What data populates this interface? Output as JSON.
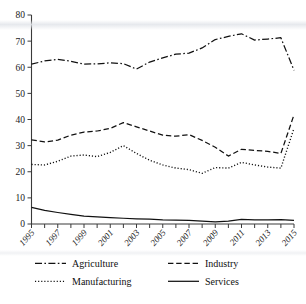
{
  "chart_data": {
    "type": "line",
    "title": "",
    "subtitle": "",
    "xlabel": "",
    "ylabel": "",
    "xlim": [
      1995,
      2015
    ],
    "ylim": [
      0,
      80
    ],
    "grid": false,
    "legend_position": "bottom",
    "x": [
      1995,
      1996,
      1997,
      1998,
      1999,
      2000,
      2001,
      2002,
      2003,
      2004,
      2005,
      2006,
      2007,
      2008,
      2009,
      2010,
      2011,
      2012,
      2013,
      2014,
      2015
    ],
    "x_tick_labels": [
      "1995",
      "1997",
      "1999",
      "2001",
      "2003",
      "2005",
      "2007",
      "2009",
      "2011",
      "2013",
      "2015"
    ],
    "x_tick_values": [
      1995,
      1997,
      1999,
      2001,
      2003,
      2005,
      2007,
      2009,
      2011,
      2013,
      2015
    ],
    "y_tick_labels": [
      "0",
      "10",
      "20",
      "30",
      "40",
      "50",
      "60",
      "70",
      "80"
    ],
    "y_tick_values": [
      0,
      10,
      20,
      30,
      40,
      50,
      60,
      70,
      80
    ],
    "series": [
      {
        "name": "Agriculture",
        "style": "dashdot",
        "color": "#111111",
        "values": [
          61.2,
          62.4,
          63.0,
          62.3,
          61.2,
          61.3,
          61.7,
          61.4,
          59.3,
          62.0,
          63.6,
          65.0,
          65.4,
          67.4,
          70.6,
          71.8,
          72.8,
          70.4,
          70.8,
          71.3,
          58.8
        ]
      },
      {
        "name": "Industry",
        "style": "dashed",
        "color": "#111111",
        "values": [
          32.2,
          31.4,
          32.1,
          34.0,
          35.2,
          35.6,
          36.6,
          38.8,
          37.2,
          35.6,
          34.0,
          33.6,
          34.2,
          32.0,
          29.4,
          26.0,
          28.6,
          28.2,
          27.8,
          27.0,
          41.8
        ]
      },
      {
        "name": "Manufacturing",
        "style": "dotted",
        "color": "#111111",
        "values": [
          22.8,
          22.6,
          24.0,
          26.0,
          26.4,
          25.8,
          27.4,
          30.0,
          27.0,
          24.4,
          22.6,
          21.4,
          20.8,
          19.4,
          21.6,
          21.4,
          23.6,
          22.6,
          21.8,
          21.4,
          36.6
        ]
      },
      {
        "name": "Services",
        "style": "solid",
        "color": "#111111",
        "values": [
          6.4,
          5.2,
          4.4,
          3.7,
          3.0,
          2.7,
          2.4,
          2.2,
          2.0,
          1.9,
          1.6,
          1.5,
          1.4,
          1.1,
          0.8,
          1.1,
          1.8,
          1.6,
          1.6,
          1.7,
          1.4
        ]
      }
    ]
  },
  "legend": {
    "items": [
      {
        "label": "Agriculture",
        "style": "dashdot"
      },
      {
        "label": "Industry",
        "style": "dashed"
      },
      {
        "label": "Manufacturing",
        "style": "dotted"
      },
      {
        "label": "Services",
        "style": "solid"
      }
    ]
  }
}
